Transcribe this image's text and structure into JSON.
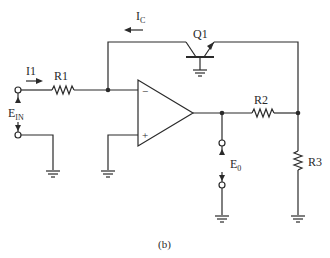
{
  "figure": {
    "caption": "(b)",
    "colors": {
      "line": "#2a2a2a",
      "background": "#ffffff"
    }
  },
  "labels": {
    "ic_main": "I",
    "ic_sub": "C",
    "q1": "Q1",
    "i1": "I1",
    "r1": "R1",
    "ein_main": "E",
    "ein_sub": "IN",
    "minus": "−",
    "plus": "+",
    "r2": "R2",
    "e0_main": "E",
    "e0_sub": "0",
    "r3": "R3"
  },
  "components": [
    {
      "id": "R1",
      "type": "resistor"
    },
    {
      "id": "R2",
      "type": "resistor"
    },
    {
      "id": "R3",
      "type": "resistor"
    },
    {
      "id": "Q1",
      "type": "transistor"
    },
    {
      "id": "U1",
      "type": "op-amp"
    }
  ]
}
